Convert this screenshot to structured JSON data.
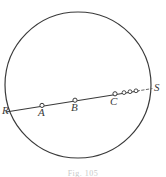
{
  "figure": {
    "kind": "geometry-diagram",
    "caption": "Fig. 105",
    "background_color": "#ffffff",
    "stroke_color": "#3a3a3a",
    "marker_fill_color": "#ffffff",
    "canvas": {
      "width": 166,
      "height": 177
    }
  },
  "circle": {
    "name": "main-circle",
    "center_x": 78,
    "center_y": 85,
    "radius": 73,
    "stroke_width": 1.2
  },
  "secant": {
    "name": "secant-line",
    "from": {
      "x": 6,
      "y": 112
    },
    "to": {
      "x": 150,
      "y": 89
    },
    "dashed_from": {
      "x": 137,
      "y": 91
    },
    "dashed_to": {
      "x": 152,
      "y": 88
    },
    "stroke_width": 1.1
  },
  "points": [
    {
      "id": "R",
      "label": "R",
      "x": 7,
      "y": 112,
      "marker": false,
      "label_x": 2,
      "label_y": 110
    },
    {
      "id": "A",
      "label": "A",
      "x": 42,
      "y": 105,
      "marker": true,
      "label_x": 38,
      "label_y": 110
    },
    {
      "id": "B",
      "label": "B",
      "x": 75,
      "y": 100,
      "marker": true,
      "label_x": 71,
      "label_y": 105
    },
    {
      "id": "C",
      "label": "C",
      "x": 115,
      "y": 94,
      "marker": true,
      "label_x": 110,
      "label_y": 99
    },
    {
      "id": "S",
      "label": "S",
      "x": 152,
      "y": 88,
      "marker": false,
      "label_x": 154,
      "label_y": 85
    }
  ],
  "ellipsis_markers": [
    {
      "x": 124,
      "y": 93
    },
    {
      "x": 130,
      "y": 92
    },
    {
      "x": 136,
      "y": 91
    }
  ],
  "marker_radius": 2.1,
  "ellipsis_radius": 1.9
}
